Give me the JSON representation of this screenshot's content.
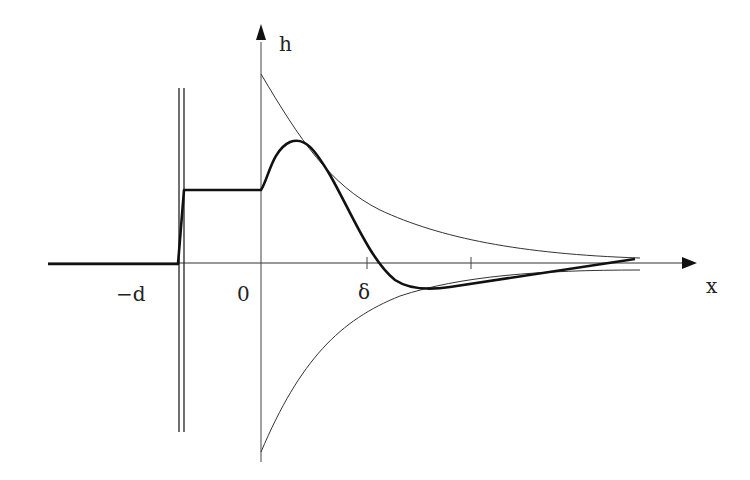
{
  "diagram": {
    "axes": {
      "x_label": "x",
      "y_label": "h"
    },
    "tick_labels": {
      "minus_d": "−d",
      "zero": "0",
      "delta": "δ"
    },
    "curves": [
      {
        "name": "wave-profile",
        "style": "thick"
      },
      {
        "name": "upper-envelope",
        "style": "thin"
      },
      {
        "name": "lower-envelope",
        "style": "thin"
      }
    ],
    "features": [
      "wall-double-line",
      "plateau-between-minus-d-and-0"
    ],
    "colors": {
      "ink": "#222222",
      "background": "#ffffff"
    }
  }
}
